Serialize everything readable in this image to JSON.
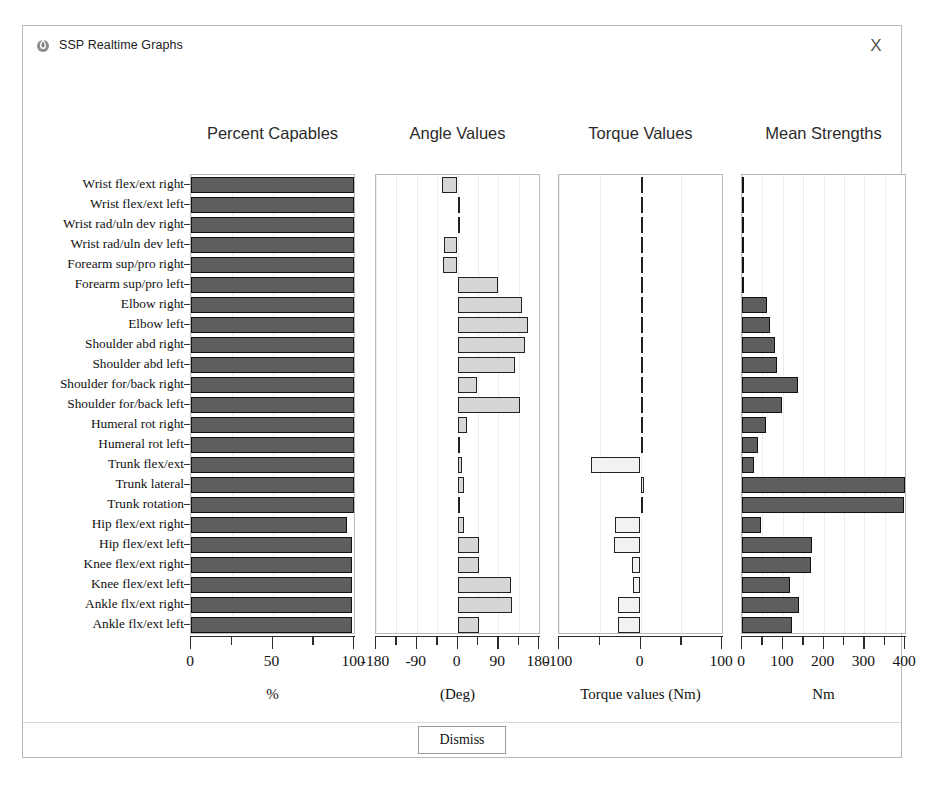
{
  "window": {
    "title": "SSP Realtime Graphs",
    "icon": "app-flame-icon",
    "close_label": "X"
  },
  "footer": {
    "dismiss_label": "Dismiss"
  },
  "joints": [
    "Wrist flex/ext right",
    "Wrist flex/ext left",
    "Wrist rad/uln dev right",
    "Wrist rad/uln dev left",
    "Forearm sup/pro right",
    "Forearm sup/pro left",
    "Elbow right",
    "Elbow left",
    "Shoulder abd right",
    "Shoulder abd left",
    "Shoulder for/back right",
    "Shoulder for/back left",
    "Humeral rot right",
    "Humeral rot left",
    "Trunk flex/ext",
    "Trunk lateral",
    "Trunk rotation",
    "Hip flex/ext right",
    "Hip flex/ext left",
    "Knee flex/ext right",
    "Knee flex/ext left",
    "Ankle flx/ext right",
    "Ankle flx/ext left"
  ],
  "chart_data": [
    {
      "type": "bar",
      "orientation": "horizontal",
      "title": "Percent Capables",
      "xlabel": "%",
      "ylabel": "",
      "xlim": [
        0,
        100
      ],
      "ticks": [
        0,
        50,
        100
      ],
      "tick_labels": [
        "0",
        "50",
        "100"
      ],
      "minor_ticks": [
        25,
        75
      ],
      "grid": true,
      "bar_style": "dark",
      "categories": [
        "Wrist flex/ext right",
        "Wrist flex/ext left",
        "Wrist rad/uln dev right",
        "Wrist rad/uln dev left",
        "Forearm sup/pro right",
        "Forearm sup/pro left",
        "Elbow right",
        "Elbow left",
        "Shoulder abd right",
        "Shoulder abd left",
        "Shoulder for/back right",
        "Shoulder for/back left",
        "Humeral rot right",
        "Humeral rot left",
        "Trunk flex/ext",
        "Trunk lateral",
        "Trunk rotation",
        "Hip flex/ext right",
        "Hip flex/ext left",
        "Knee flex/ext right",
        "Knee flex/ext left",
        "Ankle flx/ext right",
        "Ankle flx/ext left"
      ],
      "values": [
        100,
        100,
        100,
        100,
        100,
        100,
        100,
        100,
        100,
        100,
        100,
        100,
        100,
        100,
        100,
        100,
        100,
        96,
        99,
        99,
        99,
        99,
        99
      ]
    },
    {
      "type": "bar",
      "orientation": "horizontal",
      "title": "Angle Values",
      "xlabel": "(Deg)",
      "ylabel": "",
      "xlim": [
        -180,
        180
      ],
      "ticks": [
        -180,
        -90,
        0,
        90,
        180
      ],
      "tick_labels": [
        "-180",
        "-90",
        "0",
        "90",
        "180"
      ],
      "minor_ticks": [
        -135,
        -45,
        45,
        135
      ],
      "grid": true,
      "bar_style": "light",
      "categories": [
        "Wrist flex/ext right",
        "Wrist flex/ext left",
        "Wrist rad/uln dev right",
        "Wrist rad/uln dev left",
        "Forearm sup/pro right",
        "Forearm sup/pro left",
        "Elbow right",
        "Elbow left",
        "Shoulder abd right",
        "Shoulder abd left",
        "Shoulder for/back right",
        "Shoulder for/back left",
        "Humeral rot right",
        "Humeral rot left",
        "Trunk flex/ext",
        "Trunk lateral",
        "Trunk rotation",
        "Hip flex/ext right",
        "Hip flex/ext left",
        "Knee flex/ext right",
        "Knee flex/ext left",
        "Ankle flx/ext right",
        "Ankle flx/ext left"
      ],
      "values": [
        -34,
        6,
        4,
        -30,
        -32,
        90,
        143,
        155,
        148,
        126,
        44,
        138,
        20,
        2,
        10,
        14,
        2,
        14,
        48,
        47,
        119,
        120,
        48,
        44
      ]
    },
    {
      "type": "bar",
      "orientation": "horizontal",
      "title": "Torque Values",
      "xlabel": "Torque values (Nm)",
      "ylabel": "",
      "xlim": [
        -100,
        100
      ],
      "ticks": [
        -100,
        0,
        100
      ],
      "tick_labels": [
        "-100",
        "0",
        "100"
      ],
      "minor_ticks": [
        -50,
        50
      ],
      "grid": true,
      "bar_style": "hollow",
      "categories": [
        "Wrist flex/ext right",
        "Wrist flex/ext left",
        "Wrist rad/uln dev right",
        "Wrist rad/uln dev left",
        "Forearm sup/pro right",
        "Forearm sup/pro left",
        "Elbow right",
        "Elbow left",
        "Shoulder abd right",
        "Shoulder abd left",
        "Shoulder for/back right",
        "Shoulder for/back left",
        "Humeral rot right",
        "Humeral rot left",
        "Trunk flex/ext",
        "Trunk lateral",
        "Trunk rotation",
        "Hip flex/ext right",
        "Hip flex/ext left",
        "Knee flex/ext right",
        "Knee flex/ext left",
        "Ankle flx/ext right",
        "Ankle flx/ext left"
      ],
      "values": [
        0,
        0,
        0,
        0,
        0,
        0,
        0.5,
        0.5,
        2,
        2,
        0.5,
        0.5,
        0,
        0,
        -61,
        4,
        0,
        -31,
        -33,
        -10,
        -9,
        -27,
        -27
      ]
    },
    {
      "type": "bar",
      "orientation": "horizontal",
      "title": "Mean Strengths",
      "xlabel": "Nm",
      "ylabel": "",
      "xlim": [
        0,
        400
      ],
      "ticks": [
        0,
        100,
        200,
        300,
        400
      ],
      "tick_labels": [
        "0",
        "100",
        "200",
        "300",
        "400"
      ],
      "minor_ticks": [
        50,
        150,
        250,
        350
      ],
      "grid": true,
      "bar_style": "dark",
      "categories": [
        "Wrist flex/ext right",
        "Wrist flex/ext left",
        "Wrist rad/uln dev right",
        "Wrist rad/uln dev left",
        "Forearm sup/pro right",
        "Forearm sup/pro left",
        "Elbow right",
        "Elbow left",
        "Shoulder abd right",
        "Shoulder abd left",
        "Shoulder for/back right",
        "Shoulder for/back left",
        "Humeral rot right",
        "Humeral rot left",
        "Trunk flex/ext",
        "Trunk lateral",
        "Trunk rotation",
        "Hip flex/ext right",
        "Hip flex/ext left",
        "Knee flex/ext right",
        "Knee flex/ext left",
        "Ankle flx/ext right",
        "Ankle flx/ext left"
      ],
      "values": [
        5,
        5,
        5,
        5,
        5,
        5,
        62,
        68,
        80,
        86,
        137,
        97,
        60,
        40,
        30,
        400,
        398,
        46,
        172,
        170,
        118,
        140,
        122
      ]
    }
  ]
}
